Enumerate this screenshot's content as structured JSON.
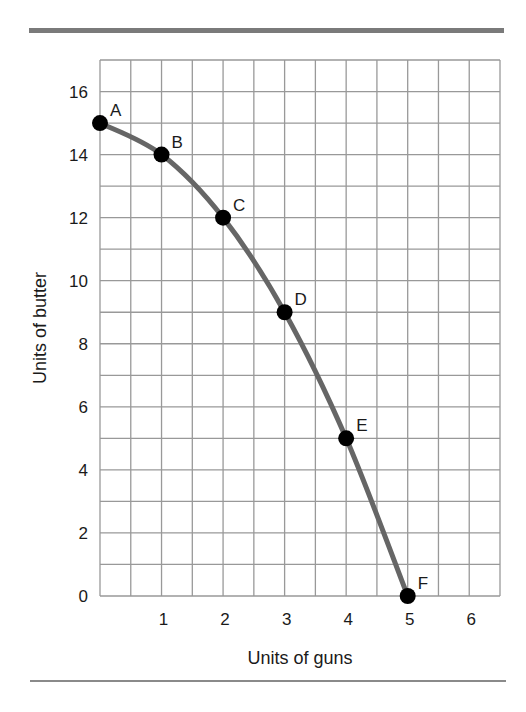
{
  "chart_data": {
    "type": "line",
    "title": "",
    "xlabel": "Units of guns",
    "ylabel": "Units of butter",
    "xlim": [
      0,
      6.5
    ],
    "ylim": [
      0,
      17
    ],
    "grid": true,
    "grid_step": {
      "x": 0.5,
      "y": 1
    },
    "x_ticks": [
      1,
      2,
      3,
      4,
      5,
      6
    ],
    "y_ticks": [
      0,
      2,
      4,
      6,
      8,
      10,
      12,
      14,
      16
    ],
    "points": [
      {
        "label": "A",
        "x": 0,
        "y": 15
      },
      {
        "label": "B",
        "x": 1,
        "y": 14
      },
      {
        "label": "C",
        "x": 2,
        "y": 12
      },
      {
        "label": "D",
        "x": 3,
        "y": 9
      },
      {
        "label": "E",
        "x": 4,
        "y": 5
      },
      {
        "label": "F",
        "x": 5,
        "y": 0
      }
    ],
    "series": [
      {
        "name": "Production possibilities frontier",
        "x": [
          0,
          1,
          2,
          3,
          4,
          5
        ],
        "values": [
          15,
          14,
          12,
          9,
          5,
          0
        ]
      }
    ],
    "legend": null
  },
  "colors": {
    "curve": "#666666",
    "point": "#000000",
    "grid": "#999999",
    "rule": "#7a7a7a"
  }
}
